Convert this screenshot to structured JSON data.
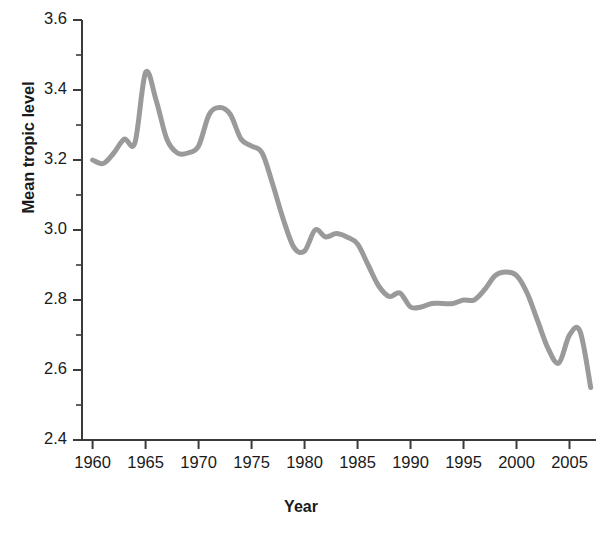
{
  "chart_data": {
    "type": "line",
    "title": "",
    "xlabel": "Year",
    "ylabel": "Mean tropic level",
    "xlim": [
      1959,
      2007.5
    ],
    "ylim": [
      2.4,
      3.6
    ],
    "xticks": [
      1960,
      1965,
      1970,
      1975,
      1980,
      1985,
      1990,
      1995,
      2000,
      2005
    ],
    "xtick_labels": [
      "1960",
      "1965",
      "1970",
      "1975",
      "1980",
      "1985",
      "1990",
      "1995",
      "2000",
      "2005"
    ],
    "yticks": [
      2.4,
      2.6,
      2.8,
      3.0,
      3.2,
      3.4,
      3.6
    ],
    "ytick_labels": [
      "2.4",
      "2.6",
      "2.8",
      "3.0",
      "3.2",
      "3.4",
      "3.6"
    ],
    "yminor_ticks": [
      2.5,
      2.7,
      2.9,
      3.1,
      3.3,
      3.5
    ],
    "grid": false,
    "legend": false,
    "legend_position": "none",
    "line_color": "#9a9a9a",
    "line_width": 5,
    "axis_color": "#3a3a3a",
    "series": [
      {
        "name": "Mean tropic level",
        "x": [
          1960,
          1961,
          1962,
          1963,
          1964,
          1965,
          1966,
          1967,
          1968,
          1969,
          1970,
          1971,
          1972,
          1973,
          1974,
          1975,
          1976,
          1977,
          1978,
          1979,
          1980,
          1981,
          1982,
          1983,
          1984,
          1985,
          1986,
          1987,
          1988,
          1989,
          1990,
          1991,
          1992,
          1993,
          1994,
          1995,
          1996,
          1997,
          1998,
          1999,
          2000,
          2001,
          2002,
          2003,
          2004,
          2005,
          2006,
          2007
        ],
        "values": [
          3.2,
          3.19,
          3.22,
          3.26,
          3.25,
          3.45,
          3.37,
          3.26,
          3.22,
          3.22,
          3.24,
          3.33,
          3.35,
          3.33,
          3.26,
          3.24,
          3.22,
          3.13,
          3.03,
          2.95,
          2.94,
          3.0,
          2.98,
          2.99,
          2.98,
          2.96,
          2.9,
          2.84,
          2.81,
          2.82,
          2.78,
          2.78,
          2.79,
          2.79,
          2.79,
          2.8,
          2.8,
          2.83,
          2.87,
          2.88,
          2.87,
          2.82,
          2.74,
          2.66,
          2.62,
          2.7,
          2.71,
          2.55
        ]
      }
    ]
  }
}
